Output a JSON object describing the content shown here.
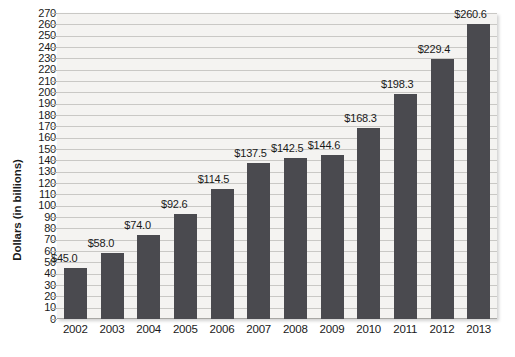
{
  "chart_data": {
    "type": "bar",
    "title": "",
    "subtitle": "",
    "xlabel": "",
    "ylabel": "Dollars (in billions)",
    "categories": [
      "2002",
      "2003",
      "2004",
      "2005",
      "2006",
      "2007",
      "2008",
      "2009",
      "2010",
      "2011",
      "2012",
      "2013"
    ],
    "values": [
      45.0,
      58.0,
      74.0,
      92.6,
      114.5,
      137.5,
      142.5,
      144.6,
      168.3,
      198.3,
      229.4,
      260.6
    ],
    "data_labels": [
      "$45.0",
      "$58.0",
      "$74.0",
      "$92.6",
      "$114.5",
      "$137.5",
      "$142.5",
      "$144.6",
      "$168.3",
      "$198.3",
      "$229.4",
      "$260.6"
    ],
    "ylim": [
      0,
      270
    ],
    "y_tick_step": 10,
    "y_tick_labels": [
      "270",
      "260",
      "250",
      "240",
      "230",
      "220",
      "210",
      "200",
      "190",
      "180",
      "170",
      "160",
      "150",
      "140",
      "130",
      "120",
      "110",
      "100",
      "90",
      "80",
      "70",
      "60",
      "50",
      "40",
      "30",
      "20",
      "10",
      "0"
    ],
    "grid": true,
    "legend": false,
    "legend_position": "none",
    "colors": {
      "bar_fill": "#4a4a4f",
      "plot_background": "#f4f3f1",
      "gridline": "#c9c8c5",
      "text": "#1a1a1a",
      "page_background": "#ffffff"
    }
  }
}
